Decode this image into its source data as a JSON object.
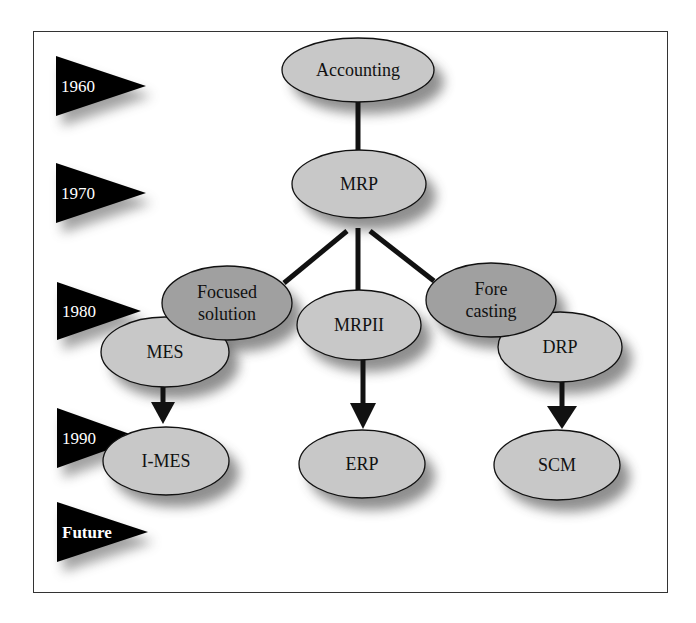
{
  "diagram": {
    "colors": {
      "frame": "#333333",
      "flag": "#000000",
      "node_light": "#c8c8c8",
      "node_dark": "#a0a0a0",
      "outline": "#111111",
      "connector": "#111111"
    },
    "timeline": [
      {
        "id": "t1960",
        "label": "1960",
        "x": 56,
        "y": 56,
        "w": 90,
        "h": 60,
        "bold": false
      },
      {
        "id": "t1970",
        "label": "1970",
        "x": 56,
        "y": 163,
        "w": 90,
        "h": 60,
        "bold": false
      },
      {
        "id": "t1980",
        "label": "1980",
        "x": 57,
        "y": 282,
        "w": 84,
        "h": 58,
        "bold": false
      },
      {
        "id": "t1990",
        "label": "1990",
        "x": 57,
        "y": 408,
        "w": 84,
        "h": 60,
        "bold": false
      },
      {
        "id": "tfuture",
        "label": "Future",
        "x": 57,
        "y": 502,
        "w": 91,
        "h": 60,
        "bold": true
      }
    ],
    "nodes": [
      {
        "id": "drp",
        "lines": [
          "DRP"
        ],
        "cx": 560,
        "cy": 347,
        "rx": 62,
        "ry": 35,
        "tone": "light",
        "text_dx": 0
      },
      {
        "id": "accounting",
        "lines": [
          "Accounting"
        ],
        "cx": 358,
        "cy": 70,
        "rx": 76,
        "ry": 32,
        "tone": "light",
        "text_dx": 0
      },
      {
        "id": "mrp",
        "lines": [
          "MRP"
        ],
        "cx": 359,
        "cy": 184,
        "rx": 67,
        "ry": 34,
        "tone": "light",
        "text_dx": 0
      },
      {
        "id": "mes",
        "lines": [
          "MES"
        ],
        "cx": 165,
        "cy": 352,
        "rx": 64,
        "ry": 35,
        "tone": "light",
        "text_dx": 0
      },
      {
        "id": "focused-solution",
        "lines": [
          "Focused",
          "solution"
        ],
        "cx": 227,
        "cy": 303,
        "rx": 65,
        "ry": 37,
        "tone": "dark",
        "text_dx": 0
      },
      {
        "id": "mrpii",
        "lines": [
          "MRPII"
        ],
        "cx": 359,
        "cy": 325,
        "rx": 62,
        "ry": 35,
        "tone": "light",
        "text_dx": 0
      },
      {
        "id": "forecasting",
        "lines": [
          "Fore",
          "casting"
        ],
        "cx": 491,
        "cy": 300,
        "rx": 65,
        "ry": 37,
        "tone": "dark",
        "text_dx": 0
      },
      {
        "id": "i-mes",
        "lines": [
          "I-MES"
        ],
        "cx": 166,
        "cy": 461,
        "rx": 63,
        "ry": 34,
        "tone": "light",
        "text_dx": 0
      },
      {
        "id": "erp",
        "lines": [
          "ERP"
        ],
        "cx": 362,
        "cy": 464,
        "rx": 63,
        "ry": 34,
        "tone": "light",
        "text_dx": 0
      },
      {
        "id": "scm",
        "lines": [
          "SCM"
        ],
        "cx": 557,
        "cy": 465,
        "rx": 63,
        "ry": 35,
        "tone": "light",
        "text_dx": 0
      }
    ],
    "lines": [
      {
        "from": "accounting",
        "to": "mrp",
        "x1": 358,
        "y1": 102,
        "x2": 358,
        "y2": 150
      },
      {
        "from": "mrp",
        "to": "focused-solution",
        "x1": 347,
        "y1": 231,
        "x2": 284,
        "y2": 283
      },
      {
        "from": "mrp",
        "to": "mrpii",
        "x1": 358,
        "y1": 228,
        "x2": 358,
        "y2": 290
      },
      {
        "from": "mrp",
        "to": "forecasting",
        "x1": 370,
        "y1": 231,
        "x2": 434,
        "y2": 281
      }
    ],
    "arrows": [
      {
        "from": "mes",
        "to": "i-mes",
        "x": 163,
        "y1": 387,
        "y_head": 402,
        "y_tip": 424,
        "half_w": 12
      },
      {
        "from": "mrpii",
        "to": "erp",
        "x": 363,
        "y1": 360,
        "y_head": 403,
        "y_tip": 429,
        "half_w": 13
      },
      {
        "from": "drp",
        "to": "scm",
        "x": 562,
        "y1": 382,
        "y_head": 406,
        "y_tip": 429,
        "half_w": 15
      }
    ]
  }
}
